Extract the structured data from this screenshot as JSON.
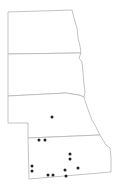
{
  "map": {
    "title": "",
    "states": [
      {
        "name": "North Dakota",
        "points": "8,12 72,10 74,18 77,28 78,38 80,46 81,53 8,54"
      },
      {
        "name": "South Dakota",
        "points": "8,54 81,53 79,58 82,62 83,72 84,84 85,92 84,97 79,95 72,94 66,93 8,96"
      },
      {
        "name": "Nebraska",
        "points": "8,96 66,93 72,94 79,95 84,97 86,104 89,112 92,120 96,127 100,135 28,138 28,123 8,123"
      },
      {
        "name": "Kansas",
        "points": "28,138 100,135 103,140 106,145 110,148 111,158 111,172 29,179"
      }
    ],
    "points": [
      {
        "x": 52,
        "y": 117,
        "state": "Nebraska"
      },
      {
        "x": 39,
        "y": 140,
        "state": "Kansas"
      },
      {
        "x": 45,
        "y": 140,
        "state": "Kansas"
      },
      {
        "x": 70,
        "y": 154,
        "state": "Kansas"
      },
      {
        "x": 70,
        "y": 159,
        "state": "Kansas"
      },
      {
        "x": 32,
        "y": 166,
        "state": "Kansas"
      },
      {
        "x": 32,
        "y": 171,
        "state": "Kansas"
      },
      {
        "x": 48,
        "y": 175,
        "state": "Kansas"
      },
      {
        "x": 53,
        "y": 175,
        "state": "Kansas"
      },
      {
        "x": 65,
        "y": 170,
        "state": "Kansas"
      },
      {
        "x": 66,
        "y": 176,
        "state": "Kansas"
      },
      {
        "x": 78,
        "y": 168,
        "state": "Kansas"
      }
    ],
    "colors": {
      "outline": "#b4b4b4",
      "dot": "#222222",
      "background": "#ffffff"
    }
  }
}
